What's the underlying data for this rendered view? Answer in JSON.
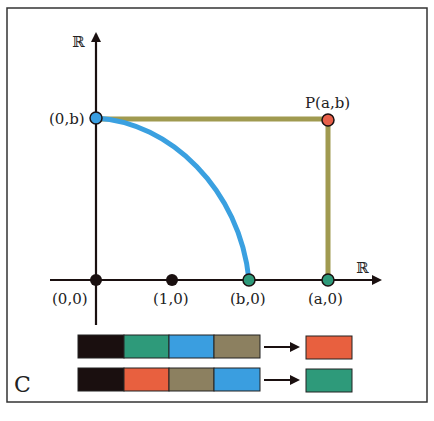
{
  "panel_label": "C",
  "axes": {
    "y_label": "ℝ",
    "x_label": "ℝ"
  },
  "points": [
    {
      "id": "0b",
      "label": "(0,b)",
      "color": "#3a9ee0"
    },
    {
      "id": "P",
      "label": "P(a,b)",
      "color": "#e8604a"
    },
    {
      "id": "00",
      "label": "(0,0)",
      "color": "#1a1010"
    },
    {
      "id": "10",
      "label": "(1,0)",
      "color": "#1a1010"
    },
    {
      "id": "b0",
      "label": "(b,0)",
      "color": "#2e9a7a"
    },
    {
      "id": "a0",
      "label": "(a,0)",
      "color": "#2e9a7a"
    }
  ],
  "colors": {
    "black": "#1a0f0f",
    "green": "#2e9a7a",
    "blue": "#3a9ee0",
    "olive": "#8c8060",
    "red": "#e8603f",
    "rect_line": "#a09a50",
    "arc": "#3aa0e0"
  },
  "sequences": [
    {
      "inputs": [
        "black",
        "green",
        "blue",
        "olive"
      ],
      "output": "red"
    },
    {
      "inputs": [
        "black",
        "red",
        "olive",
        "blue"
      ],
      "output": "green"
    }
  ]
}
